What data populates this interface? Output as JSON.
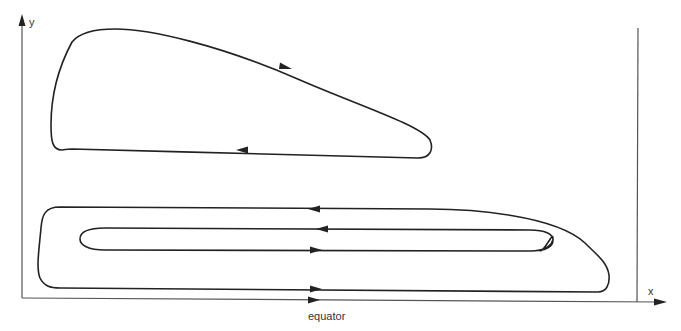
{
  "diagram": {
    "type": "circulation-cells",
    "axes": {
      "y_label": "y",
      "x_label": "x",
      "bottom_label": "equator"
    },
    "cells": [
      {
        "name": "upper-cell",
        "direction": "clockwise",
        "description": "Upper isolated gyre in northwest region"
      },
      {
        "name": "outer-lower-cell",
        "direction": "counterclockwise",
        "description": "Large elongated loop along the equator"
      },
      {
        "name": "inner-lower-cell",
        "direction": "counterclockwise",
        "description": "Narrow inner loop nested inside lower cell"
      }
    ],
    "colors": {
      "line": "#222222",
      "axis": "#555555",
      "background": "#ffffff"
    }
  }
}
